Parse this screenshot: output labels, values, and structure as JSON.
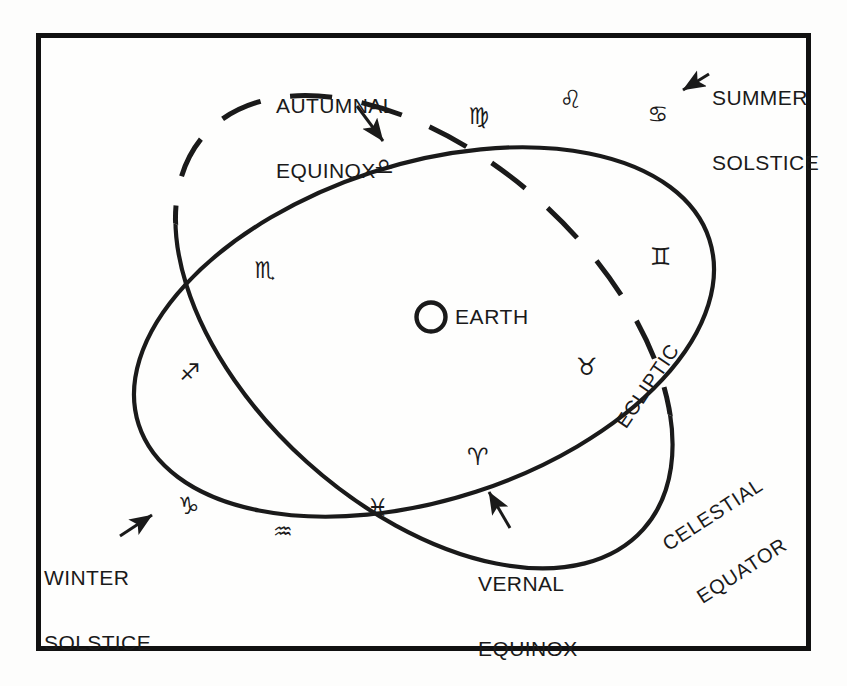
{
  "figure": {
    "kind": "astronomy-diagram",
    "ink_color": "#1a1a1a",
    "background_color": "#fefefd",
    "frame_color": "#111111"
  },
  "center": {
    "body_label": "EARTH",
    "body_icon": "circle-outline-icon"
  },
  "curves": {
    "celestial_equator": {
      "label": "CELESTIAL\nEQUATOR",
      "style": "solid",
      "tilt_deg": -18
    },
    "ecliptic": {
      "label": "ECLIPTIC",
      "style": "solid-front-dashed-back",
      "tilt_deg": 42
    }
  },
  "cardinal_points": [
    {
      "id": "autumnal-equinox",
      "label": "AUTUMNAL\nEQUINOX",
      "sign": "♎",
      "sign_name": "libra"
    },
    {
      "id": "summer-solstice",
      "label": "SUMMER\nSOLSTICE",
      "sign": "♋",
      "sign_name": "cancer"
    },
    {
      "id": "winter-solstice",
      "label": "WINTER\nSOLSTICE",
      "sign": "♑",
      "sign_name": "capricorn"
    },
    {
      "id": "vernal-equinox",
      "label": "VERNAL\nEQUINOX",
      "sign": "♈",
      "sign_name": "aries"
    }
  ],
  "zodiac": [
    {
      "name": "virgo",
      "symbol": "♍",
      "x": 480,
      "y": 116,
      "size": 23
    },
    {
      "name": "leo",
      "symbol": "♌",
      "x": 572,
      "y": 99,
      "size": 25
    },
    {
      "name": "cancer",
      "symbol": "♋",
      "x": 659,
      "y": 114,
      "size": 23
    },
    {
      "name": "gemini",
      "symbol": "♊",
      "x": 662,
      "y": 257,
      "size": 24
    },
    {
      "name": "taurus",
      "symbol": "♉",
      "x": 588,
      "y": 367,
      "size": 24
    },
    {
      "name": "aries",
      "symbol": "♈",
      "x": 479,
      "y": 457,
      "size": 24
    },
    {
      "name": "pisces",
      "symbol": "♓",
      "x": 379,
      "y": 508,
      "size": 24
    },
    {
      "name": "aquarius",
      "symbol": "♒",
      "x": 284,
      "y": 532,
      "size": 22
    },
    {
      "name": "capricorn",
      "symbol": "♑",
      "x": 190,
      "y": 506,
      "size": 24
    },
    {
      "name": "sagittarius",
      "symbol": "♐",
      "x": 191,
      "y": 372,
      "size": 23
    },
    {
      "name": "scorpio",
      "symbol": "♏",
      "x": 266,
      "y": 270,
      "size": 23
    },
    {
      "name": "libra",
      "symbol": "♎",
      "x": 385,
      "y": 167,
      "size": 22
    }
  ],
  "labels": {
    "autumnal_equinox_line1": "AUTUMNAL",
    "autumnal_equinox_line2": "EQUINOX",
    "summer_solstice_line1": "SUMMER",
    "summer_solstice_line2": "SOLSTICE",
    "winter_solstice_line1": "WINTER",
    "winter_solstice_line2": "SOLSTICE",
    "vernal_equinox_line1": "VERNAL",
    "vernal_equinox_line2": "EQUINOX",
    "ecliptic": "ECLIPTIC",
    "celestial_equator_line1": "CELESTIAL",
    "celestial_equator_line2": "EQUATOR",
    "earth": "EARTH"
  }
}
